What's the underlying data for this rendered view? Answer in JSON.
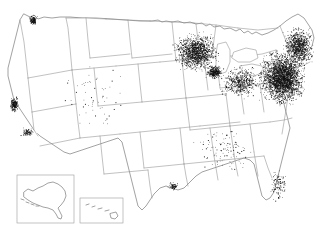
{
  "map": {
    "title": "United States Dot Density Map",
    "projection": "albers-usa",
    "background_color": "#ffffff",
    "boundary_color": "#8d8d8d",
    "dot_color": "#101010",
    "inset_border_color": "#9a9a9a",
    "regions": [
      {
        "name": "contiguous-united-states",
        "label": "Lower 48 States"
      },
      {
        "name": "alaska-inset",
        "label": "Alaska"
      },
      {
        "name": "hawaii-inset",
        "label": "Hawaii"
      }
    ],
    "insets": [
      {
        "name": "alaska-inset",
        "x": 17,
        "y": 175,
        "width": 57,
        "height": 48
      },
      {
        "name": "hawaii-inset",
        "x": 80,
        "y": 198,
        "width": 43,
        "height": 25
      }
    ],
    "density_clusters": [
      {
        "name": "northeast-megalopolis",
        "intensity": "very-high",
        "cx": 282,
        "cy": 78,
        "rx": 26,
        "ry": 30,
        "dots": 2600
      },
      {
        "name": "new-england",
        "intensity": "high",
        "cx": 298,
        "cy": 46,
        "rx": 17,
        "ry": 22,
        "dots": 900
      },
      {
        "name": "upper-midwest",
        "intensity": "high",
        "cx": 196,
        "cy": 52,
        "rx": 26,
        "ry": 22,
        "dots": 1300
      },
      {
        "name": "great-lakes-ohio",
        "intensity": "medium",
        "cx": 240,
        "cy": 82,
        "rx": 24,
        "ry": 18,
        "dots": 520
      },
      {
        "name": "chicago-area",
        "intensity": "high",
        "cx": 214,
        "cy": 72,
        "rx": 9,
        "ry": 8,
        "dots": 330
      },
      {
        "name": "san-francisco-bay",
        "intensity": "medium",
        "cx": 14,
        "cy": 104,
        "rx": 5,
        "ry": 9,
        "dots": 210
      },
      {
        "name": "los-angeles-basin",
        "intensity": "low",
        "cx": 27,
        "cy": 132,
        "rx": 7,
        "ry": 5,
        "dots": 90
      },
      {
        "name": "puget-sound",
        "intensity": "medium",
        "cx": 33,
        "cy": 20,
        "rx": 5,
        "ry": 6,
        "dots": 130
      },
      {
        "name": "florida-coast",
        "intensity": "low",
        "cx": 278,
        "cy": 185,
        "rx": 9,
        "ry": 18,
        "dots": 120
      },
      {
        "name": "houston-gulf",
        "intensity": "low",
        "cx": 173,
        "cy": 186,
        "rx": 6,
        "ry": 5,
        "dots": 70
      },
      {
        "name": "mountain-west-sparse",
        "intensity": "very-low",
        "cx": 95,
        "cy": 95,
        "rx": 45,
        "ry": 40,
        "dots": 60
      },
      {
        "name": "deep-south-sparse",
        "intensity": "very-low",
        "cx": 225,
        "cy": 150,
        "rx": 35,
        "ry": 25,
        "dots": 110
      }
    ]
  }
}
